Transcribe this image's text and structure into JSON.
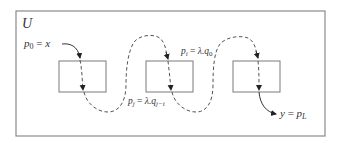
{
  "diagram": {
    "set_label": "U",
    "colors": {
      "frame": "#8a8a8a",
      "box": "#7a7a7a",
      "path": "#333333"
    },
    "boxes": [
      {
        "id": "box-1",
        "x": 59,
        "y": 61,
        "width": 47,
        "height": 31
      },
      {
        "id": "box-2",
        "x": 146,
        "y": 61,
        "width": 47,
        "height": 31
      },
      {
        "id": "box-3",
        "x": 233,
        "y": 61,
        "width": 47,
        "height": 31
      }
    ],
    "labels": {
      "start": {
        "var": "p",
        "sub": "0",
        "eq": " = ",
        "rhs": "x"
      },
      "p_i": {
        "var": "p",
        "sub": "i",
        "eq": " = ",
        "rhs": "λ.q",
        "rhs_sub": "0"
      },
      "p_j": {
        "var": "p",
        "sub": "j",
        "eq": " = ",
        "rhs": "λ.q",
        "rhs_sub": "j−i"
      },
      "end": {
        "lhs": "y",
        "eq": " = ",
        "var": "p",
        "sub": "L"
      }
    }
  }
}
